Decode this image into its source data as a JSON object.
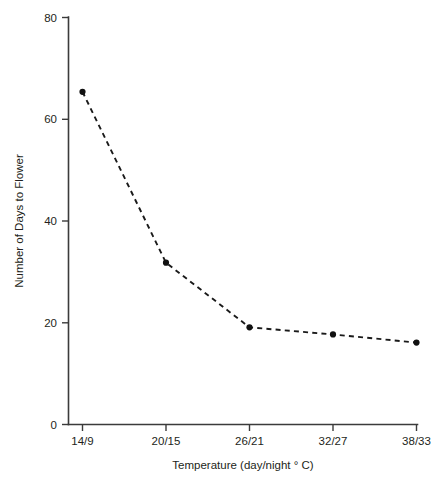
{
  "chart_data": {
    "type": "line",
    "title": "",
    "subtitle": "",
    "xlabel": "Temperature (day/night ° C)",
    "ylabel": "Number of Days to Flower",
    "categories": [
      "14/9",
      "20/15",
      "26/21",
      "32/27",
      "38/33"
    ],
    "values": [
      65.4,
      31.8,
      19.1,
      17.7,
      16.1
    ],
    "series": [
      {
        "name": "Days to Flower",
        "values": [
          65.4,
          31.8,
          19.1,
          17.7,
          16.1
        ]
      }
    ],
    "ylim": [
      0,
      80
    ],
    "yticks": [
      "0",
      "20",
      "40",
      "60",
      "80"
    ],
    "ytick_values": [
      0,
      20,
      40,
      60,
      80
    ],
    "xticks": [
      "14/9",
      "20/15",
      "26/21",
      "32/27",
      "38/33"
    ],
    "grid": false,
    "legend": "none",
    "line_style": "dashed",
    "marker": "circle",
    "colors": {
      "line": "#1a1a1a",
      "marker": "#111111",
      "axis": "#3b3b3b",
      "text": "#231f20",
      "background": "#ffffff"
    }
  }
}
